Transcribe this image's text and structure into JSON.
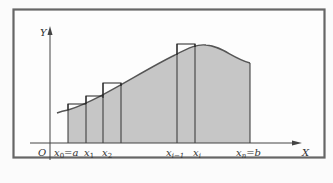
{
  "figure": {
    "title": "",
    "axes": {
      "x_label": "X",
      "y_label": "Y",
      "origin_label": "O"
    },
    "tick_labels": {
      "x0": "x",
      "x0_sub": "0",
      "eq_a": "=a",
      "x1": "x",
      "x1_sub": "1",
      "x2": "x",
      "x2_sub": "2",
      "xim1": "x",
      "xim1_sub": "i−1",
      "xi": "x",
      "xi_sub": "i",
      "xn": "x",
      "xn_sub": "n",
      "eq_b": "=b"
    },
    "colors": {
      "frame": "#666666",
      "fill": "#c4c4c4",
      "curve": "#555555",
      "rect_stroke": "#222222",
      "axis": "#444444",
      "background": "#fbfbfb"
    }
  }
}
